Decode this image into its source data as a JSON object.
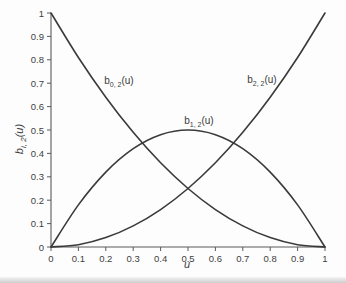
{
  "figure": {
    "background": "#fdfdfd",
    "curve_color": "#3a3a3a",
    "axis_color": "#5a5a5a",
    "text_color": "#3e3e3e"
  },
  "chart_data": {
    "type": "line",
    "title": "",
    "xlabel": "u",
    "ylabel": "b i, 2 (u)",
    "ylabel_parts": {
      "base": "b",
      "sub": "i, 2",
      "rest": "(u)"
    },
    "xlim": [
      0,
      1
    ],
    "ylim": [
      0,
      1
    ],
    "grid": false,
    "legend": "none (inline curve labels)",
    "x_ticks": [
      "0",
      "0.1",
      "0.2",
      "0.3",
      "0.4",
      "0.5",
      "0.6",
      "0.7",
      "0.8",
      "0.9",
      "1"
    ],
    "y_ticks": [
      "0",
      "0.1",
      "0.2",
      "0.3",
      "0.4",
      "0.5",
      "0.6",
      "0.7",
      "0.8",
      "0.9",
      "1"
    ],
    "x": [
      0,
      0.1,
      0.2,
      0.3,
      0.4,
      0.5,
      0.6,
      0.7,
      0.8,
      0.9,
      1.0
    ],
    "series": [
      {
        "name": "b0,2(u)",
        "values": [
          1,
          0.81,
          0.64,
          0.49,
          0.36,
          0.25,
          0.16,
          0.09,
          0.04,
          0.01,
          0
        ]
      },
      {
        "name": "b1,2(u)",
        "values": [
          0,
          0.18,
          0.32,
          0.42,
          0.48,
          0.5,
          0.48,
          0.42,
          0.32,
          0.18,
          0
        ]
      },
      {
        "name": "b2,2(u)",
        "values": [
          0,
          0.01,
          0.04,
          0.09,
          0.16,
          0.25,
          0.36,
          0.49,
          0.64,
          0.81,
          1
        ]
      }
    ],
    "annotations": [
      {
        "base": "b",
        "sub": "0, 2",
        "rest": "(u)",
        "u": 0.248,
        "v": 0.705
      },
      {
        "base": "b",
        "sub": "1, 2",
        "rest": "(u)",
        "u": 0.54,
        "v": 0.535
      },
      {
        "base": "b",
        "sub": "2, 2",
        "rest": "(u)",
        "u": 0.77,
        "v": 0.71
      }
    ]
  }
}
